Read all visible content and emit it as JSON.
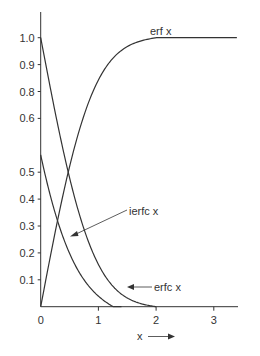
{
  "chart_data": {
    "type": "line",
    "title": "",
    "xlabel": "x",
    "ylabel": "",
    "xlim": [
      0,
      3.4
    ],
    "ylim": [
      0,
      1.05
    ],
    "x_ticks": [
      {
        "value": 0,
        "label": "0"
      },
      {
        "value": 1,
        "label": "1"
      },
      {
        "value": 2,
        "label": "2"
      },
      {
        "value": 3,
        "label": "3"
      }
    ],
    "y_ticks": [
      {
        "value": 0.1,
        "label": "0.1"
      },
      {
        "value": 0.2,
        "label": "0.2"
      },
      {
        "value": 0.3,
        "label": "0.3"
      },
      {
        "value": 0.4,
        "label": "0.4"
      },
      {
        "value": 0.5,
        "label": "0.5"
      },
      {
        "value": 0.7,
        "label": "0.6"
      },
      {
        "value": 0.8,
        "label": "0.8"
      },
      {
        "value": 0.9,
        "label": "0.9"
      },
      {
        "value": 1.0,
        "label": "1.0"
      }
    ],
    "grid": false,
    "legend": "none (curves labelled inline)",
    "series": [
      {
        "name": "erf x",
        "x": [
          0,
          0.1,
          0.2,
          0.3,
          0.4,
          0.5,
          0.6,
          0.8,
          1.0,
          1.2,
          1.4,
          1.6,
          1.8,
          2.0,
          2.5,
          3.0,
          3.4
        ],
        "y": [
          0,
          0.112,
          0.223,
          0.329,
          0.428,
          0.52,
          0.604,
          0.742,
          0.843,
          0.91,
          0.952,
          0.976,
          0.989,
          0.995,
          1.0,
          1.0,
          1.0
        ]
      },
      {
        "name": "erfc x",
        "x": [
          0,
          0.1,
          0.2,
          0.3,
          0.4,
          0.5,
          0.6,
          0.8,
          1.0,
          1.2,
          1.4,
          1.6,
          1.8,
          2.0
        ],
        "y": [
          1.0,
          0.888,
          0.777,
          0.671,
          0.572,
          0.48,
          0.396,
          0.258,
          0.157,
          0.09,
          0.048,
          0.024,
          0.011,
          0.0
        ]
      },
      {
        "name": "ierfc x",
        "x": [
          0,
          0.1,
          0.2,
          0.3,
          0.4,
          0.5,
          0.6,
          0.8,
          1.0,
          1.2,
          1.4
        ],
        "y": [
          0.564,
          0.47,
          0.387,
          0.314,
          0.251,
          0.199,
          0.155,
          0.09,
          0.05,
          0.026,
          0.0
        ]
      }
    ],
    "annotations": [
      {
        "text": "erf x",
        "target": "erf x",
        "arrow": false
      },
      {
        "text": "ierfc x",
        "target": "ierfc x",
        "arrow": true
      },
      {
        "text": "erfc x",
        "target": "erfc x",
        "arrow": true
      },
      {
        "text": "x",
        "note": "x-axis label with right-pointing arrow",
        "arrow": true
      }
    ]
  },
  "labels": {
    "erf": "erf x",
    "ierfc": "ierfc x",
    "erfc": "erfc x",
    "xaxis": "x"
  },
  "colors": {
    "line": "#333333",
    "text": "#333333",
    "background": "#ffffff"
  }
}
